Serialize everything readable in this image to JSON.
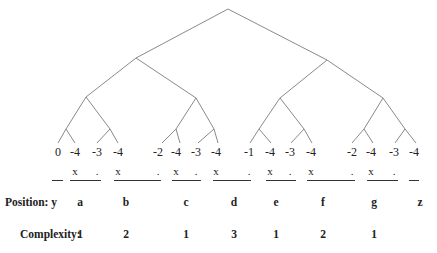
{
  "diagram": {
    "type": "binary-tree-derivation",
    "tree_edges": [
      [
        228,
        9,
        136,
        58
      ],
      [
        228,
        9,
        327,
        60
      ],
      [
        136,
        58,
        86,
        97
      ],
      [
        136,
        58,
        196,
        98
      ],
      [
        327,
        60,
        280,
        98
      ],
      [
        327,
        60,
        383,
        98
      ],
      [
        86,
        97,
        66,
        129
      ],
      [
        86,
        97,
        110,
        129
      ],
      [
        196,
        98,
        176,
        129
      ],
      [
        196,
        98,
        214,
        129
      ],
      [
        280,
        98,
        259,
        129
      ],
      [
        280,
        98,
        304,
        129
      ],
      [
        383,
        98,
        364,
        129
      ],
      [
        383,
        98,
        405,
        129
      ],
      [
        66,
        129,
        58,
        143
      ],
      [
        66,
        129,
        75,
        143
      ],
      [
        110,
        129,
        97,
        143
      ],
      [
        110,
        129,
        118,
        143
      ],
      [
        176,
        129,
        162,
        143
      ],
      [
        176,
        129,
        180,
        143
      ],
      [
        214,
        129,
        198,
        143
      ],
      [
        214,
        129,
        218,
        143
      ],
      [
        259,
        129,
        250,
        143
      ],
      [
        259,
        129,
        271,
        143
      ],
      [
        304,
        129,
        291,
        143
      ],
      [
        304,
        129,
        312,
        143
      ],
      [
        364,
        129,
        352,
        143
      ],
      [
        364,
        129,
        373,
        143
      ],
      [
        405,
        129,
        395,
        143
      ],
      [
        405,
        129,
        416,
        143
      ]
    ],
    "leaf_values": [
      {
        "label": "0",
        "x": 58
      },
      {
        "label": "-4",
        "x": 75
      },
      {
        "label": "-3",
        "x": 97
      },
      {
        "label": "-4",
        "x": 118
      },
      {
        "label": "-2",
        "x": 158
      },
      {
        "label": "-4",
        "x": 176
      },
      {
        "label": "-3",
        "x": 196
      },
      {
        "label": "-4",
        "x": 216
      },
      {
        "label": "-1",
        "x": 249
      },
      {
        "label": "-4",
        "x": 270
      },
      {
        "label": "-3",
        "x": 290
      },
      {
        "label": "-4",
        "x": 311
      },
      {
        "label": "-2",
        "x": 352
      },
      {
        "label": "-4",
        "x": 371
      },
      {
        "label": "-3",
        "x": 394
      },
      {
        "label": "-4",
        "x": 414
      }
    ],
    "symbols": [
      {
        "label": "x",
        "x": 75
      },
      {
        "label": ".",
        "x": 97
      },
      {
        "label": "x",
        "x": 118
      },
      {
        "label": ".",
        "x": 158
      },
      {
        "label": "x",
        "x": 176
      },
      {
        "label": ".",
        "x": 196
      },
      {
        "label": "x",
        "x": 216
      },
      {
        "label": ".",
        "x": 249
      },
      {
        "label": "x",
        "x": 270
      },
      {
        "label": ".",
        "x": 290
      },
      {
        "label": "x",
        "x": 311
      },
      {
        "label": ".",
        "x": 352
      },
      {
        "label": "x",
        "x": 371
      },
      {
        "label": ".",
        "x": 394
      }
    ],
    "underlines": [
      {
        "x1": 52,
        "x2": 63
      },
      {
        "x1": 70,
        "x2": 101
      },
      {
        "x1": 114,
        "x2": 161
      },
      {
        "x1": 172,
        "x2": 201
      },
      {
        "x1": 213,
        "x2": 251
      },
      {
        "x1": 266,
        "x2": 296
      },
      {
        "x1": 307,
        "x2": 355
      },
      {
        "x1": 367,
        "x2": 398
      },
      {
        "x1": 409,
        "x2": 419
      }
    ],
    "position_row": {
      "label": "Position:",
      "items": [
        {
          "label": "y",
          "x": 54
        },
        {
          "label": "a",
          "x": 80
        },
        {
          "label": "b",
          "x": 126
        },
        {
          "label": "c",
          "x": 186
        },
        {
          "label": "d",
          "x": 234
        },
        {
          "label": "e",
          "x": 276
        },
        {
          "label": "f",
          "x": 323
        },
        {
          "label": "g",
          "x": 374
        },
        {
          "label": "z",
          "x": 420
        }
      ]
    },
    "complexity_row": {
      "label": "Complexity:",
      "items": [
        {
          "label": "1",
          "x": 80
        },
        {
          "label": "2",
          "x": 126
        },
        {
          "label": "1",
          "x": 186
        },
        {
          "label": "3",
          "x": 234
        },
        {
          "label": "1",
          "x": 276
        },
        {
          "label": "2",
          "x": 323
        },
        {
          "label": "1",
          "x": 374
        }
      ]
    }
  }
}
